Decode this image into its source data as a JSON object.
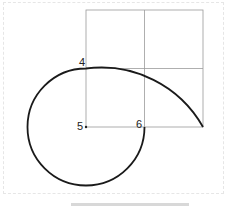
{
  "diagram": {
    "type": "golden-spiral-construction",
    "labels": [
      {
        "id": "4",
        "text": "4"
      },
      {
        "id": "5",
        "text": "5"
      },
      {
        "id": "6",
        "text": "6"
      }
    ],
    "colors": {
      "grid": "#9a9a9a",
      "curve": "#1a1a1a",
      "label": "#222222"
    }
  }
}
